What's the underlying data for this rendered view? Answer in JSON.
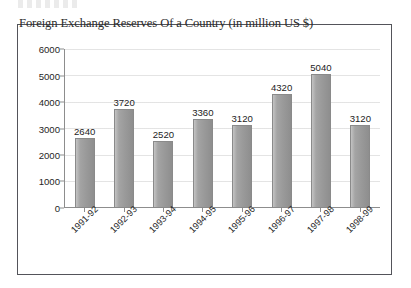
{
  "page": {
    "scan_artifact_present": true
  },
  "chart_data": {
    "type": "bar",
    "title": "Foreign Exchange Reserves Of a Country (in million US $)",
    "xlabel": "",
    "ylabel": "",
    "categories": [
      "1991-92",
      "1992-93",
      "1993-94",
      "1994-95",
      "1995-96",
      "1996-97",
      "1997-98",
      "1998-99"
    ],
    "values": [
      2640,
      3720,
      2520,
      3360,
      3120,
      4320,
      5040,
      3120
    ],
    "data_labels": [
      "2640",
      "3720",
      "2520",
      "3360",
      "3120",
      "4320",
      "5040",
      "3120"
    ],
    "ylim": [
      0,
      6000
    ],
    "y_ticks": [
      0,
      1000,
      2000,
      3000,
      4000,
      5000,
      6000
    ],
    "y_tick_labels": [
      "0",
      "1000",
      "2000",
      "3000",
      "4000",
      "5000",
      "6000"
    ],
    "grid": true,
    "legend": false,
    "legend_position": "none",
    "series_color": "#9a9a9a",
    "frame_color": "#53545a",
    "axis_color": "#8d8d8d",
    "text_color": "#1f1f1f",
    "background": "#ffffff"
  }
}
